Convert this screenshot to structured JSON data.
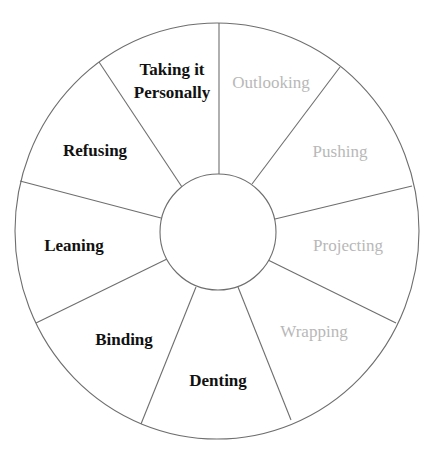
{
  "diagram": {
    "type": "segmented-wheel",
    "segments": [
      {
        "label_line1": "Taking it",
        "label_line2": "Personally",
        "state": "active"
      },
      {
        "label_line1": "Outlooking",
        "label_line2": "",
        "state": "inactive"
      },
      {
        "label_line1": "Pushing",
        "label_line2": "",
        "state": "inactive"
      },
      {
        "label_line1": "Projecting",
        "label_line2": "",
        "state": "inactive"
      },
      {
        "label_line1": "Wrapping",
        "label_line2": "",
        "state": "inactive"
      },
      {
        "label_line1": "Denting",
        "label_line2": "",
        "state": "active"
      },
      {
        "label_line1": "Binding",
        "label_line2": "",
        "state": "active"
      },
      {
        "label_line1": "Leaning",
        "label_line2": "",
        "state": "active"
      },
      {
        "label_line1": "Refusing",
        "label_line2": "",
        "state": "active"
      }
    ],
    "colors": {
      "active_text": "#111111",
      "inactive_text": "#b8b8b8",
      "line": "#6e6e6e",
      "background": "#ffffff"
    }
  }
}
